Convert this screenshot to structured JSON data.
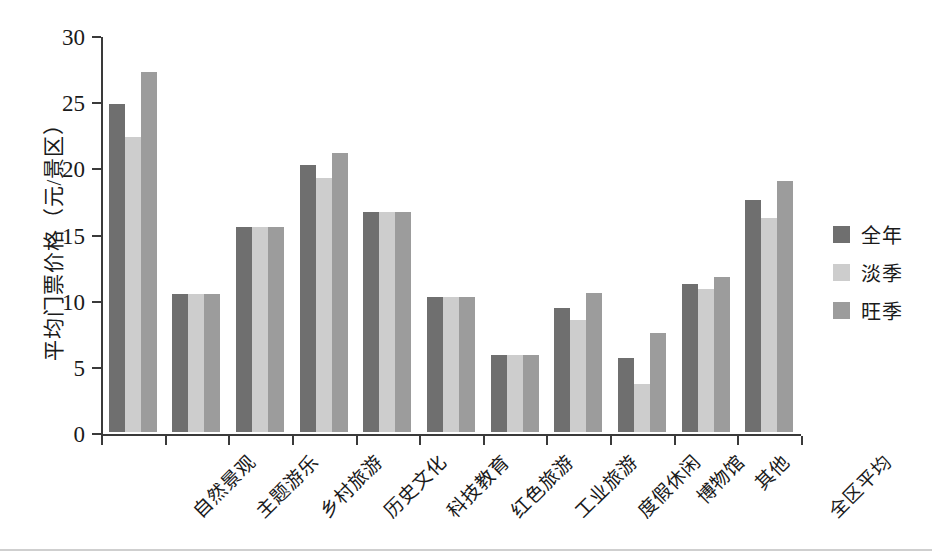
{
  "chart_data": {
    "type": "bar",
    "title": "",
    "xlabel": "",
    "ylabel": "平均门票价格（元/景区）",
    "ylim": [
      0,
      30
    ],
    "yticks": [
      0,
      5,
      10,
      15,
      20,
      25,
      30
    ],
    "grid": false,
    "legend_position": "right",
    "categories": [
      "自然景观",
      "主题游乐",
      "乡村旅游",
      "历史文化",
      "科技教育",
      "红色旅游",
      "工业旅游",
      "度假休闲",
      "博物馆",
      "其他",
      "全区平均"
    ],
    "series": [
      {
        "name": "全年",
        "color": "#6f6f6f",
        "values": [
          24.8,
          10.4,
          15.5,
          20.2,
          16.6,
          10.2,
          5.8,
          9.4,
          5.6,
          11.2,
          17.5
        ]
      },
      {
        "name": "淡季",
        "color": "#cdcdcd",
        "values": [
          22.3,
          10.4,
          15.5,
          19.2,
          16.6,
          10.2,
          5.8,
          8.5,
          3.6,
          10.8,
          16.2
        ]
      },
      {
        "name": "旺季",
        "color": "#9c9c9c",
        "values": [
          27.2,
          10.4,
          15.5,
          21.1,
          16.6,
          10.2,
          5.8,
          10.5,
          7.5,
          11.7,
          19.0
        ]
      }
    ]
  }
}
